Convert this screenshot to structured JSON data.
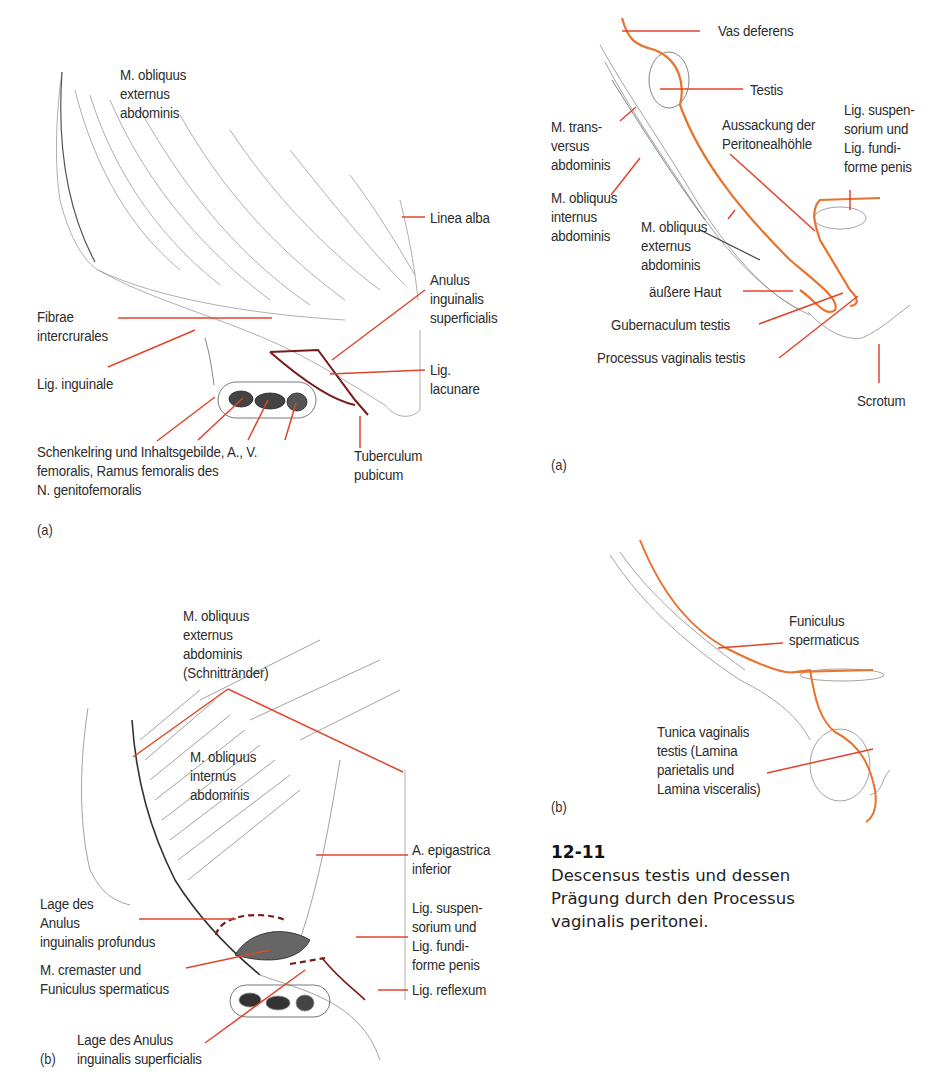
{
  "figure": {
    "number": "12-11",
    "caption_lines": [
      "Descensus testis und dessen",
      "Prägung durch den Processus",
      "vaginalis peritonei."
    ],
    "leader_color": "#e0452b",
    "accent_outline_color": "#e8722e",
    "structure_dark_red": "#7a1a1a"
  },
  "left_panel_a": {
    "tag": "(a)",
    "labels": {
      "obliquus_externus": "M. obliquus\nexternus\nabdominis",
      "linea_alba": "Linea alba",
      "anulus_superficialis": "Anulus\ninguinalis\nsuperficialis",
      "fibrae_intercrurales": "Fibrae\nintercrurales",
      "lig_inguinale": "Lig. inguinale",
      "lig_lacunare": "Lig.\nlacunare",
      "schenkelring": "Schenkelring und Inhaltsgebilde, A., V.\nfemoralis, Ramus femoralis des\nN. genitofemoralis",
      "tuberculum_pubicum": "Tuberculum\npubicum"
    }
  },
  "left_panel_b": {
    "tag": "(b)",
    "labels": {
      "obliquus_externus_schnitt": "M. obliquus\nexternus\nabdominis\n(Schnittränder)",
      "obliquus_internus": "M. obliquus\ninternus\nabdominis",
      "epigastrica_inferior": "A. epigastrica\ninferior",
      "anulus_profundus": "Lage des\nAnulus\ninguinalis profundus",
      "lig_suspensorium": "Lig. suspen-\nsorium und\nLig. fundi-\nforme penis",
      "cremaster": "M. cremaster und\nFuniculus spermaticus",
      "lig_reflexum": "Lig. reflexum",
      "anulus_superficialis": "Lage des Anulus\ninguinalis superficialis"
    }
  },
  "right_panel_a": {
    "tag": "(a)",
    "labels": {
      "vas_deferens": "Vas deferens",
      "testis": "Testis",
      "transversus": "M. trans-\nversus\nabdominis",
      "aussackung": "Aussackung der\nPeritonealhöhle",
      "lig_suspensorium": "Lig. suspen-\nsorium und\nLig. fundi-\nforme penis",
      "obliquus_internus": "M. obliquus\ninternus\nabdominis",
      "obliquus_externus": "M. obliquus\nexternus\nabdominis",
      "aeussere_haut": "äußere Haut",
      "gubernaculum": "Gubernaculum testis",
      "processus_vaginalis": "Processus vaginalis testis",
      "scrotum": "Scrotum"
    }
  },
  "right_panel_b": {
    "tag": "(b)",
    "labels": {
      "funiculus": "Funiculus\nspermaticus",
      "tunica_vaginalis": "Tunica vaginalis\ntestis (Lamina\nparietalis und\nLamina visceralis)"
    }
  }
}
